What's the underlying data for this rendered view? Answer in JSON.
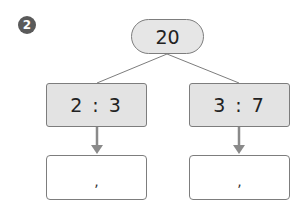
{
  "problem": {
    "number": "2",
    "total": "20",
    "ratios": [
      {
        "label": "2 : 3",
        "answer_placeholder": ","
      },
      {
        "label": "3 : 7",
        "answer_placeholder": ","
      }
    ]
  },
  "colors": {
    "badge": "#5a5a5a",
    "box_fill": "#e3e3e3",
    "border": "#7d7d7d",
    "arrow": "#8a8a8a"
  }
}
